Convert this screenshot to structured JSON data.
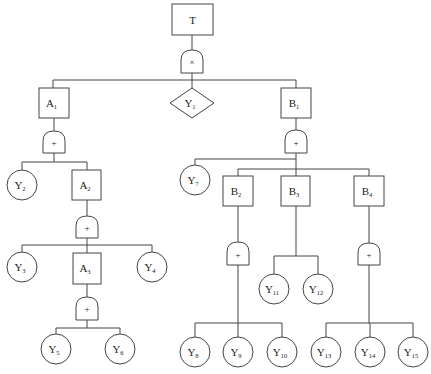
{
  "diagram": {
    "type": "fault-tree",
    "line_color": "#444444",
    "top_event": {
      "id": "T",
      "label": "T"
    },
    "gates": [
      {
        "id": "G0",
        "type": "AND",
        "symbol": "×",
        "parent": "T",
        "children": [
          "A1",
          "Y1",
          "B1"
        ]
      },
      {
        "id": "G1",
        "type": "OR",
        "symbol": "+",
        "parent": "A1",
        "children": [
          "Y2",
          "A2"
        ]
      },
      {
        "id": "G2",
        "type": "OR",
        "symbol": "+",
        "parent": "A2",
        "children": [
          "Y3",
          "A3",
          "Y4"
        ]
      },
      {
        "id": "G3",
        "type": "OR",
        "symbol": "+",
        "parent": "A3",
        "children": [
          "Y5",
          "Y6"
        ]
      },
      {
        "id": "G4",
        "type": "OR",
        "symbol": "+",
        "parent": "B1",
        "children": [
          "Y7",
          "B2",
          "B3",
          "B4"
        ]
      },
      {
        "id": "G5",
        "type": "OR",
        "symbol": "+",
        "parent": "B2",
        "children": [
          "Y8",
          "Y9",
          "Y10"
        ]
      },
      {
        "id": "G6",
        "type": "NONE",
        "symbol": "",
        "parent": "B3",
        "children": [
          "Y11",
          "Y12"
        ]
      },
      {
        "id": "G7",
        "type": "OR",
        "symbol": "+",
        "parent": "B4",
        "children": [
          "Y13",
          "Y14",
          "Y15"
        ]
      }
    ],
    "intermediate_events": [
      {
        "id": "A1",
        "base": "A",
        "sub": "1"
      },
      {
        "id": "A2",
        "base": "A",
        "sub": "2"
      },
      {
        "id": "A3",
        "base": "A",
        "sub": "3"
      },
      {
        "id": "B1",
        "base": "B",
        "sub": "1"
      },
      {
        "id": "B2",
        "base": "B",
        "sub": "2"
      },
      {
        "id": "B3",
        "base": "B",
        "sub": "3"
      },
      {
        "id": "B4",
        "base": "B",
        "sub": "4"
      }
    ],
    "undeveloped_events": [
      {
        "id": "Y1",
        "base": "Y",
        "sub": "1"
      }
    ],
    "basic_events": [
      {
        "id": "Y2",
        "base": "Y",
        "sub": "2"
      },
      {
        "id": "Y3",
        "base": "Y",
        "sub": "3"
      },
      {
        "id": "Y4",
        "base": "Y",
        "sub": "4"
      },
      {
        "id": "Y5",
        "base": "Y",
        "sub": "5"
      },
      {
        "id": "Y6",
        "base": "Y",
        "sub": "6"
      },
      {
        "id": "Y7",
        "base": "Y",
        "sub": "7"
      },
      {
        "id": "Y8",
        "base": "Y",
        "sub": "8"
      },
      {
        "id": "Y9",
        "base": "Y",
        "sub": "9"
      },
      {
        "id": "Y10",
        "base": "Y",
        "sub": "10"
      },
      {
        "id": "Y11",
        "base": "Y",
        "sub": "11"
      },
      {
        "id": "Y12",
        "base": "Y",
        "sub": "12"
      },
      {
        "id": "Y13",
        "base": "Y",
        "sub": "13"
      },
      {
        "id": "Y14",
        "base": "Y",
        "sub": "14"
      },
      {
        "id": "Y15",
        "base": "Y",
        "sub": "15"
      }
    ]
  }
}
